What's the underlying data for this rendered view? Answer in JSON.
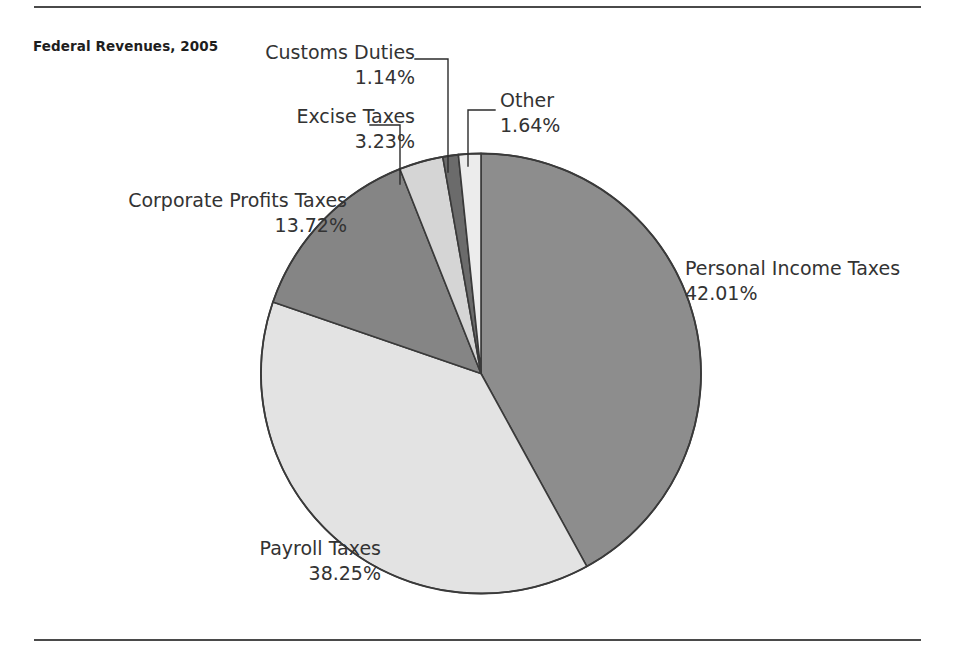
{
  "chart_data": {
    "type": "pie",
    "title": "Federal Revenues, 2005",
    "xlabel": "",
    "ylabel": "",
    "legend_position": "callout-labels",
    "grid": false,
    "start_angle_deg": 0,
    "direction": "clockwise",
    "categories": [
      "Personal Income Taxes",
      "Payroll Taxes",
      "Corporate Profits Taxes",
      "Excise Taxes",
      "Customs Duties",
      "Other"
    ],
    "values": [
      42.01,
      38.25,
      13.72,
      3.23,
      1.14,
      1.64
    ],
    "value_labels": [
      "42.01%",
      "38.25%",
      "13.72%",
      "3.23%",
      "1.14%",
      "1.64%"
    ],
    "units": "percent",
    "total": 99.99,
    "slice_colors": [
      "#8d8d8d",
      "#e3e3e3",
      "#858585",
      "#d5d5d5",
      "#6b6b6b",
      "#ececec"
    ],
    "slices": [
      {
        "name": "Personal Income Taxes",
        "value": 42.01,
        "value_label": "42.01%",
        "color": "#8d8d8d"
      },
      {
        "name": "Payroll Taxes",
        "value": 38.25,
        "value_label": "38.25%",
        "color": "#e3e3e3"
      },
      {
        "name": "Corporate Profits Taxes",
        "value": 13.72,
        "value_label": "13.72%",
        "color": "#858585"
      },
      {
        "name": "Excise Taxes",
        "value": 3.23,
        "value_label": "3.23%",
        "color": "#d5d5d5"
      },
      {
        "name": "Customs Duties",
        "value": 1.14,
        "value_label": "1.14%",
        "color": "#6b6b6b"
      },
      {
        "name": "Other",
        "value": 1.64,
        "value_label": "1.64%",
        "color": "#ececec"
      }
    ]
  },
  "figure": {
    "title": "Federal Revenues, 2005",
    "rule_color": "#4a4a4a",
    "outline_color": "#3a3a3a",
    "leader_color": "#2b2b2b",
    "background": "#ffffff"
  },
  "labels": {
    "customs": {
      "name": "Customs Duties",
      "value": "1.14%"
    },
    "excise": {
      "name": "Excise Taxes",
      "value": "3.23%"
    },
    "corporate": {
      "name": "Corporate Profits Taxes",
      "value": "13.72%"
    },
    "payroll": {
      "name": "Payroll Taxes",
      "value": "38.25%"
    },
    "other": {
      "name": "Other",
      "value": "1.64%"
    },
    "personal": {
      "name": "Personal Income Taxes",
      "value": "42.01%"
    }
  }
}
